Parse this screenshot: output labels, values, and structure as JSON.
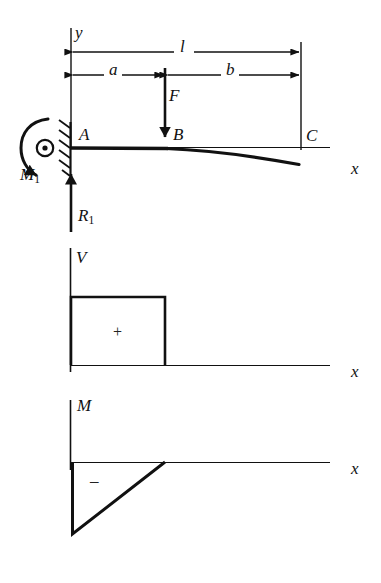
{
  "figure": {
    "ink_color": "#111111",
    "background": "#ffffff"
  },
  "beam_diagram": {
    "name": "beam-free-body-diagram",
    "axis_labels": {
      "y": "y",
      "x": "x"
    },
    "points": [
      {
        "id": "A",
        "label": "A",
        "x_px": 83,
        "y_px": 135
      },
      {
        "id": "B",
        "label": "B",
        "x_px": 176,
        "y_px": 135
      },
      {
        "id": "C",
        "label": "C",
        "x_px": 309,
        "y_px": 136
      }
    ],
    "dimensions": [
      {
        "id": "l",
        "label": "l",
        "from": "A",
        "to": "C",
        "y_px": 52,
        "label_x_px": 183,
        "label_y_px": 40
      },
      {
        "id": "a",
        "label": "a",
        "from": "A",
        "to": "B",
        "y_px": 75,
        "label_x_px": 113,
        "label_y_px": 63
      },
      {
        "id": "b",
        "label": "b",
        "from": "B",
        "to": "C",
        "y_px": 75,
        "label_x_px": 229,
        "label_y_px": 63
      }
    ],
    "loads": [
      {
        "id": "F",
        "label": "F",
        "type": "concentrated-force",
        "direction": "down",
        "x_px": 165,
        "label_x_px": 171,
        "label_y_px": 90
      }
    ],
    "reactions": [
      {
        "id": "R1",
        "label": "R",
        "subscript": "1",
        "type": "reaction-force",
        "direction": "up",
        "x_px": 71,
        "label_x_px": 75,
        "label_y_px": 205
      },
      {
        "id": "M1",
        "label": "M",
        "subscript": "1",
        "type": "reaction-moment",
        "direction": "counterclockwise",
        "label_x_px": 22,
        "label_y_px": 173
      }
    ],
    "support": {
      "type": "fixed-wall-hatched",
      "x_px": 70,
      "at_point": "A"
    },
    "deflection_curve": {
      "description": "beam deflects downward to the right of B"
    }
  },
  "shear_diagram": {
    "name": "shear-force-diagram",
    "axis_labels": {
      "y": "V",
      "x": "x"
    },
    "sign_label": "+",
    "regions": [
      {
        "from": "A",
        "to": "B",
        "value_sign": "positive",
        "shape": "constant-rectangle",
        "x_start_px": 71,
        "x_end_px": 165,
        "top_px": 297,
        "baseline_px": 365
      },
      {
        "from": "B",
        "to": "C",
        "value_sign": "zero",
        "shape": "flat-zero"
      }
    ],
    "axis_label_pos": {
      "V_x_px": 78,
      "V_y_px": 253,
      "x_x_px": 355,
      "x_y_px": 372
    }
  },
  "moment_diagram": {
    "name": "bending-moment-diagram",
    "axis_labels": {
      "y": "M",
      "x": "x"
    },
    "sign_label": "–",
    "regions": [
      {
        "from": "A",
        "to": "B",
        "value_sign": "negative",
        "shape": "linear-ramp-to-zero",
        "x_start_px": 73,
        "x_end_px": 165,
        "min_px": 533,
        "baseline_px": 462
      },
      {
        "from": "B",
        "to": "C",
        "value_sign": "zero",
        "shape": "flat-zero"
      }
    ],
    "axis_label_pos": {
      "M_x_px": 80,
      "M_y_px": 405,
      "x_x_px": 355,
      "x_y_px": 469
    }
  }
}
